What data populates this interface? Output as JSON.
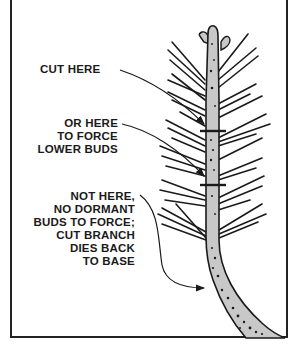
{
  "diagram": {
    "type": "pruning illustration",
    "labels": {
      "cut_here": "CUT HERE",
      "or_here": "OR HERE\nTO FORCE\nLOWER BUDS",
      "not_here": "NOT HERE,\nNO DORMANT\nBUDS TO FORCE;\nCUT BRANCH\nDIES BACK\nTO BASE"
    },
    "colors": {
      "ink": "#1a1a1a",
      "stem_fill": "#c8c8c8",
      "background": "#ffffff"
    }
  }
}
